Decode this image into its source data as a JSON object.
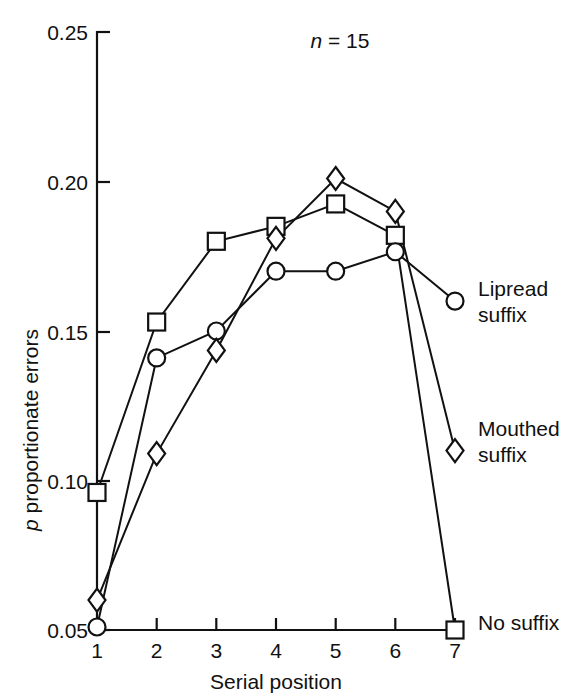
{
  "chart_data": {
    "type": "line",
    "title": "",
    "xlabel": "Serial position",
    "ylabel": "p proportionate errors",
    "ylabel_italic_prefix": "p",
    "ylabel_rest": " proportionate errors",
    "x": [
      1,
      2,
      3,
      4,
      5,
      6,
      7
    ],
    "categories": [
      "1",
      "2",
      "3",
      "4",
      "5",
      "6",
      "7"
    ],
    "xlim": [
      1,
      7
    ],
    "ylim": [
      0.05,
      0.25
    ],
    "ytick_labels": [
      "0.25",
      "0.20",
      "0.15",
      "0.10",
      "0.05"
    ],
    "ytick_values": [
      0.25,
      0.2,
      0.15,
      0.1,
      0.05
    ],
    "xtick_labels": [
      "1",
      "2",
      "3",
      "4",
      "5",
      "6",
      "7"
    ],
    "grid": false,
    "legend_position": "right-inline-labels",
    "annotation": "n = 15",
    "annotation_italic": "n",
    "annotation_rest": " = 15",
    "series": [
      {
        "name": "No suffix",
        "marker": "square",
        "label_line1": "No",
        "label_line2": "suffix",
        "label": "No suffix",
        "values": [
          0.096,
          0.153,
          0.18,
          0.185,
          0.1925,
          0.182,
          0.05
        ]
      },
      {
        "name": "Lipread suffix",
        "marker": "circle",
        "label_line1": "Lipread",
        "label_line2": "suffix",
        "label": "Lipread suffix",
        "values": [
          0.051,
          0.141,
          0.15,
          0.17,
          0.17,
          0.1765,
          0.16
        ]
      },
      {
        "name": "Mouthed suffix",
        "marker": "diamond",
        "label_line1": "Mouthed",
        "label_line2": "suffix",
        "label": "Mouthed suffix",
        "values": [
          0.06,
          0.109,
          0.1435,
          0.181,
          0.201,
          0.19,
          0.11
        ]
      }
    ]
  },
  "colors": {
    "ink": "#111111",
    "background": "#ffffff",
    "marker_fill": "#ffffff"
  }
}
